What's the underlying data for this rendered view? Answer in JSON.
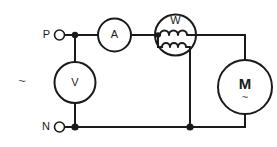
{
  "diagram": {
    "background_color": "#ffffff",
    "line_color": "#1a1a1a",
    "terminals": [
      {
        "id": "phase",
        "label": "P",
        "icon": "open-circle-terminal",
        "position": "top-left"
      },
      {
        "id": "neutral",
        "label": "N",
        "icon": "open-circle-terminal",
        "position": "bottom-left"
      }
    ],
    "supply": {
      "symbol": "~",
      "meaning": "alternating current supply"
    },
    "components": [
      {
        "id": "ammeter",
        "label": "A",
        "type": "ammeter",
        "shape": "circle",
        "connection": "series",
        "rail": "top"
      },
      {
        "id": "wattmeter",
        "label": "W",
        "type": "wattmeter",
        "shape": "circle",
        "connection": "series-current-coil-and-shunt-voltage-coil",
        "coils": [
          {
            "id": "current-coil",
            "name": "current coil",
            "orientation": "horizontal",
            "turns": 3
          },
          {
            "id": "voltage-coil",
            "name": "voltage coil",
            "orientation": "horizontal",
            "turns": 4
          }
        ]
      },
      {
        "id": "voltmeter",
        "label": "V",
        "type": "voltmeter",
        "shape": "circle",
        "connection": "parallel",
        "rail": "between-top-and-bottom"
      },
      {
        "id": "motor",
        "label": "M",
        "sub_label": "~",
        "type": "ac-motor",
        "shape": "circle",
        "connection": "load"
      }
    ],
    "junctions": [
      {
        "id": "junction-voltmeter-top",
        "rail": "top"
      },
      {
        "id": "junction-voltmeter-bottom",
        "rail": "bottom"
      },
      {
        "id": "junction-wattmeter-coil",
        "rail": "wattmeter-left"
      },
      {
        "id": "junction-wattmeter-bottom",
        "rail": "bottom"
      }
    ]
  }
}
